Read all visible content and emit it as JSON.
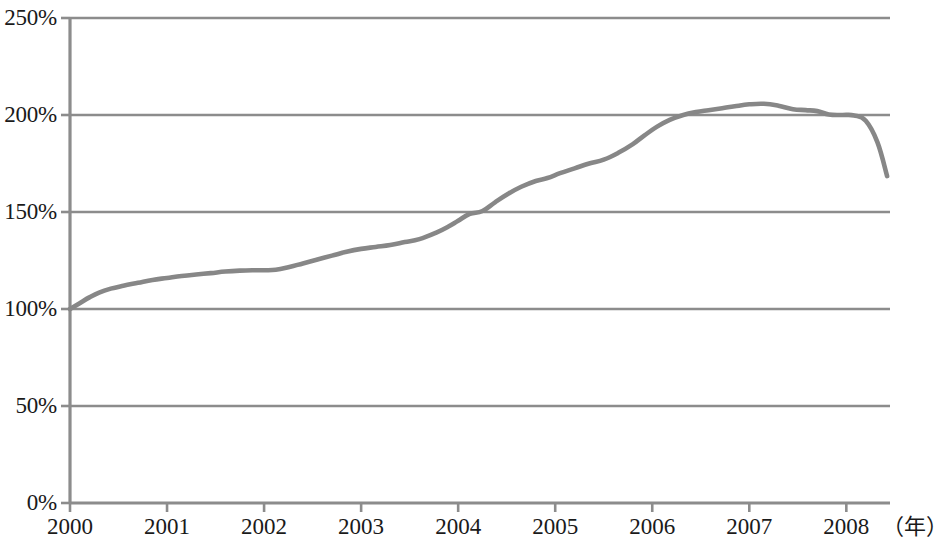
{
  "chart_data": {
    "type": "line",
    "title": "",
    "subtitle": "",
    "xlabel": "（年）",
    "ylabel": "",
    "grid": true,
    "legend": false,
    "legend_position": "none",
    "line_color": "#878787",
    "axis_color": "#8c8c8c",
    "grid_color": "#8c8c8c",
    "xlim": [
      2000,
      2008.45
    ],
    "ylim": [
      0,
      250
    ],
    "y_ticks": [
      0,
      50,
      100,
      150,
      200,
      250
    ],
    "y_tick_labels": [
      "0%",
      "50%",
      "100%",
      "150%",
      "200%",
      "250%"
    ],
    "x_ticks": [
      2000,
      2001,
      2002,
      2003,
      2004,
      2005,
      2006,
      2007,
      2008
    ],
    "x_tick_labels": [
      "2000",
      "2001",
      "2002",
      "2003",
      "2004",
      "2005",
      "2006",
      "2007",
      "2008"
    ],
    "series": [
      {
        "name": "index",
        "x": [
          2000.0,
          2000.1,
          2000.2,
          2000.3,
          2000.42,
          2000.55,
          2000.7,
          2000.85,
          2001.0,
          2001.15,
          2001.3,
          2001.45,
          2001.6,
          2001.75,
          2001.88,
          2002.0,
          2002.12,
          2002.25,
          2002.4,
          2002.55,
          2002.7,
          2002.85,
          2003.0,
          2003.15,
          2003.3,
          2003.45,
          2003.6,
          2003.78,
          2003.9,
          2004.0,
          2004.12,
          2004.25,
          2004.38,
          2004.52,
          2004.65,
          2004.8,
          2004.92,
          2005.05,
          2005.2,
          2005.35,
          2005.5,
          2005.65,
          2005.8,
          2005.92,
          2006.05,
          2006.18,
          2006.32,
          2006.45,
          2006.58,
          2006.72,
          2006.85,
          2007.0,
          2007.15,
          2007.3,
          2007.45,
          2007.58,
          2007.7,
          2007.82,
          2007.95,
          2008.08,
          2008.2,
          2008.32,
          2008.42
        ],
        "values": [
          100.0,
          103.0,
          106.0,
          108.5,
          110.5,
          112.0,
          113.5,
          115.0,
          116.0,
          117.0,
          117.8,
          118.5,
          119.3,
          119.8,
          120.0,
          120.0,
          120.2,
          121.5,
          123.5,
          125.5,
          127.5,
          129.5,
          131.0,
          132.0,
          133.0,
          134.5,
          136.0,
          139.5,
          142.5,
          145.5,
          149.0,
          150.5,
          155.0,
          159.5,
          163.0,
          166.0,
          167.5,
          170.0,
          172.5,
          175.0,
          177.0,
          180.5,
          185.0,
          189.5,
          194.0,
          197.5,
          200.0,
          201.5,
          202.5,
          203.5,
          204.5,
          205.5,
          205.8,
          204.8,
          203.0,
          202.5,
          202.0,
          200.3,
          200.0,
          199.8,
          197.0,
          186.0,
          168.5
        ]
      }
    ],
    "annotations": []
  },
  "axes": {
    "x_unit_label": "（年）"
  }
}
